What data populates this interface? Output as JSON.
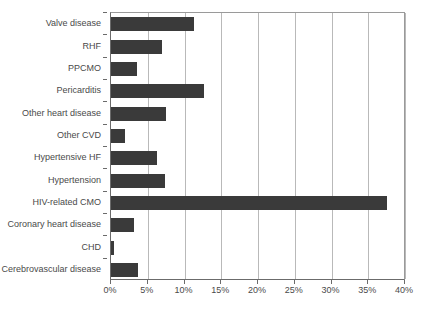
{
  "chart_data": {
    "type": "bar",
    "orientation": "horizontal",
    "title": "",
    "subtitle": "",
    "xlabel": "",
    "ylabel": "",
    "xlim": [
      0,
      40
    ],
    "xtick_labels": [
      "0%",
      "5%",
      "10%",
      "15%",
      "20%",
      "25%",
      "30%",
      "35%",
      "40%"
    ],
    "xtick_values": [
      0,
      5,
      10,
      15,
      20,
      25,
      30,
      35,
      40
    ],
    "grid": true,
    "legend": false,
    "legend_position": "none",
    "bar_color": "#3a3a3a",
    "grid_color": "#b9b9b9",
    "axis_color": "#6b6b6b",
    "label_color": "#4a4a4a",
    "unit": "%",
    "categories": [
      "Valve disease",
      "RHF",
      "PPCMO",
      "Pericarditis",
      "Other heart disease",
      "Other CVD",
      "Hypertensive HF",
      "Hypertension",
      "HIV-related CMO",
      "Coronary heart disease",
      "CHD",
      "Cerebrovascular disease"
    ],
    "values": [
      11.3,
      6.9,
      3.6,
      12.7,
      7.5,
      1.9,
      6.3,
      7.3,
      37.5,
      3.1,
      0.4,
      3.7
    ]
  }
}
